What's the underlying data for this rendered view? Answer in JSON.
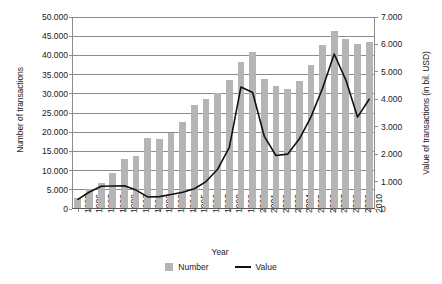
{
  "chart_data": {
    "type": "bar",
    "title": "",
    "xlabel": "Year",
    "ylabel": "Number of transactions",
    "ylabel_secondary": "Value of transactions (in bil. USD)",
    "grid": true,
    "legend_position": "bottom-center",
    "categories": [
      "1985",
      "1986",
      "1987",
      "1988",
      "1989",
      "1990",
      "1991",
      "1992",
      "1993",
      "1994",
      "1995",
      "1996",
      "1997",
      "1998",
      "1999",
      "2000",
      "2001",
      "2002",
      "2003",
      "2004",
      "2005",
      "2006",
      "2007",
      "2008",
      "2009",
      "2010"
    ],
    "ylim": [
      0,
      50000
    ],
    "yticks": [
      "0",
      "5.000",
      "10.000",
      "15.000",
      "20.000",
      "25.000",
      "30.000",
      "35.000",
      "40.000",
      "45.000",
      "50.000"
    ],
    "ytick_values": [
      0,
      5000,
      10000,
      15000,
      20000,
      25000,
      30000,
      35000,
      40000,
      45000,
      50000
    ],
    "ylim_secondary": [
      0,
      7000
    ],
    "yticks_secondary": [
      "0",
      "1.000",
      "2.000",
      "3.000",
      "4.000",
      "5.000",
      "6.000",
      "7.000"
    ],
    "ytick_values_secondary": [
      0,
      1000,
      2000,
      3000,
      4000,
      5000,
      6000,
      7000
    ],
    "series": [
      {
        "name": "Number",
        "type": "bar",
        "axis": "left",
        "color": "#b5b5b5",
        "values": [
          2500,
          5000,
          6600,
          9000,
          12800,
          13500,
          18200,
          18000,
          19500,
          22500,
          26900,
          28400,
          30000,
          33400,
          37900,
          40700,
          33700,
          31900,
          30900,
          33000,
          37200,
          42500,
          46000,
          44000,
          42700,
          43300
        ]
      },
      {
        "name": "Value",
        "type": "line",
        "axis": "right",
        "color": "#111111",
        "values": [
          350,
          620,
          830,
          840,
          850,
          690,
          440,
          450,
          530,
          610,
          740,
          1000,
          1450,
          2250,
          4450,
          4250,
          2650,
          1950,
          2000,
          2550,
          3350,
          4400,
          5650,
          4700,
          3350,
          4000
        ]
      }
    ]
  },
  "legend": {
    "items": [
      {
        "label": "Number",
        "kind": "bar"
      },
      {
        "label": "Value",
        "kind": "line"
      }
    ]
  }
}
